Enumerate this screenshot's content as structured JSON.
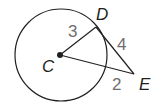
{
  "diagram": {
    "type": "geometry",
    "circle": {
      "center": "C",
      "cx": 61,
      "cy": 55,
      "r": 46
    },
    "points": {
      "C": {
        "label": "C",
        "x": 60,
        "y": 55
      },
      "D": {
        "label": "D",
        "x": 96,
        "y": 27
      },
      "E": {
        "label": "E",
        "x": 134,
        "y": 74
      }
    },
    "segments": [
      {
        "from": "C",
        "to": "D",
        "length_label": "3"
      },
      {
        "from": "D",
        "to": "E",
        "length_label": "4"
      },
      {
        "from": "C",
        "to": "E",
        "external_part_label": "2"
      }
    ],
    "labels": {
      "c": "C",
      "d": "D",
      "e": "E",
      "cd_length": "3",
      "de_length": "4",
      "external_length": "2"
    },
    "colors": {
      "stroke": "#231f20",
      "number_labels": "#6d6e71"
    }
  }
}
